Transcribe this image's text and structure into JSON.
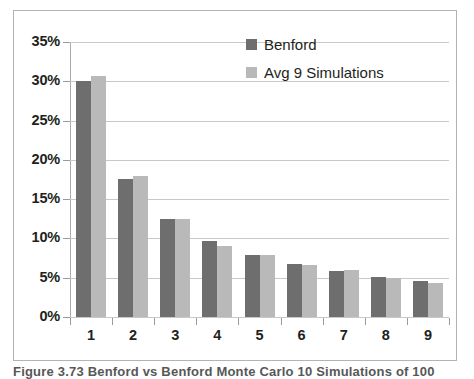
{
  "chart_data": {
    "type": "bar",
    "title": "",
    "xlabel": "",
    "ylabel": "",
    "categories": [
      "1",
      "2",
      "3",
      "4",
      "5",
      "6",
      "7",
      "8",
      "9"
    ],
    "series": [
      {
        "name": "Benford",
        "color": "#6e6e6e",
        "values": [
          30.1,
          17.6,
          12.5,
          9.7,
          7.9,
          6.7,
          5.8,
          5.1,
          4.6
        ]
      },
      {
        "name": "Avg 9 Simulations",
        "color": "#b9b9b9",
        "values": [
          30.7,
          17.9,
          12.5,
          9.0,
          7.9,
          6.6,
          6.0,
          5.0,
          4.3
        ]
      }
    ],
    "ylim": [
      0,
      35
    ],
    "yticks": [
      0,
      5,
      10,
      15,
      20,
      25,
      30,
      35
    ],
    "ytick_labels": [
      "0%",
      "5%",
      "10%",
      "15%",
      "20%",
      "25%",
      "30%",
      "35%"
    ],
    "grid": true,
    "legend_position": "top-right"
  },
  "legend": {
    "items": [
      {
        "label": "Benford"
      },
      {
        "label": "Avg 9 Simulations"
      }
    ]
  },
  "caption": {
    "text": "Figure 3.73  Benford vs Benford Monte Carlo 10 Simulations of 100"
  }
}
